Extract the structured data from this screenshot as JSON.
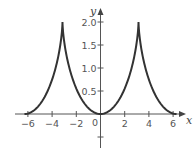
{
  "chart_data": {
    "type": "line",
    "title": "",
    "xlabel": "x",
    "ylabel": "y",
    "xlim": [
      -6.5,
      7
    ],
    "ylim": [
      -0.75,
      2.2
    ],
    "grid": false,
    "legend": null,
    "x_ticks": [
      -6,
      -4,
      -2,
      0,
      2,
      4,
      6
    ],
    "x_tick_labels": [
      "−6",
      "−4",
      "−2",
      "0",
      "2",
      "4",
      "6"
    ],
    "y_ticks": [
      0.5,
      1.0,
      1.5,
      2.0,
      -0.5
    ],
    "y_tick_labels": [
      "0.5",
      "1.0",
      "1.5",
      "2.0",
      ""
    ],
    "series": [
      {
        "name": "curve",
        "color": "#333333",
        "points": [
          [
            -6.283,
            0.0
          ],
          [
            -5.04,
            0.199
          ],
          [
            -4.37,
            0.5
          ],
          [
            -3.712,
            1.0
          ],
          [
            -3.323,
            1.5
          ],
          [
            -3.183,
            1.878
          ],
          [
            -3.1416,
            2.0
          ],
          [
            -3.1,
            1.878
          ],
          [
            -2.96,
            1.5
          ],
          [
            -2.571,
            1.0
          ],
          [
            -1.913,
            0.5
          ],
          [
            -1.24,
            0.199
          ],
          [
            0.0,
            0.0
          ],
          [
            1.24,
            0.199
          ],
          [
            1.913,
            0.5
          ],
          [
            2.571,
            1.0
          ],
          [
            2.96,
            1.5
          ],
          [
            3.1,
            1.878
          ],
          [
            3.1416,
            2.0
          ],
          [
            3.183,
            1.878
          ],
          [
            3.323,
            1.5
          ],
          [
            3.712,
            1.0
          ],
          [
            4.37,
            0.5
          ],
          [
            5.04,
            0.199
          ],
          [
            6.283,
            0.0
          ]
        ]
      }
    ]
  },
  "axes": {
    "x_label": "x",
    "y_label": "y",
    "origin_label": "0"
  }
}
